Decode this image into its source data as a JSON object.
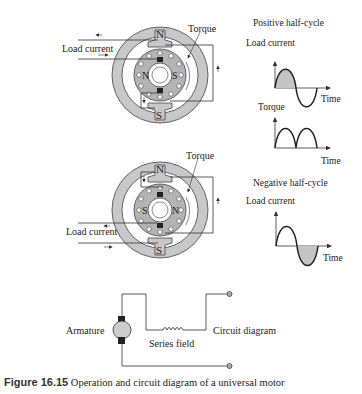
{
  "motor_top": {
    "pole_north": "N",
    "pole_south": "S",
    "rotor_pole_left": "N",
    "rotor_pole_right": "S",
    "label_load_current": "Load current",
    "label_torque": "Torque"
  },
  "motor_bottom": {
    "pole_north": "N",
    "pole_south": "S",
    "rotor_pole_left": "S",
    "rotor_pole_right": "N",
    "label_load_current": "Load current",
    "label_torque": "Torque"
  },
  "graphs": {
    "positive": {
      "title": "Positive half-cycle",
      "current_label": "Load current",
      "current_axis": "Time",
      "torque_label": "Torque",
      "torque_axis": "Time"
    },
    "negative": {
      "title": "Negative half-cycle",
      "current_label": "Load current",
      "current_axis": "Time"
    }
  },
  "circuit": {
    "armature_label": "Armature",
    "series_field_label": "Series field",
    "circuit_label": "Circuit diagram"
  },
  "caption": {
    "figure_number": "Figure 16.15",
    "text": "Operation and circuit diagram of a universal motor"
  },
  "colors": {
    "stator_fill": "#c8c8c8",
    "rotor_fill": "#b4b4b4",
    "shaded_half_cycle": "#c4c4c4",
    "line": "#333333"
  }
}
